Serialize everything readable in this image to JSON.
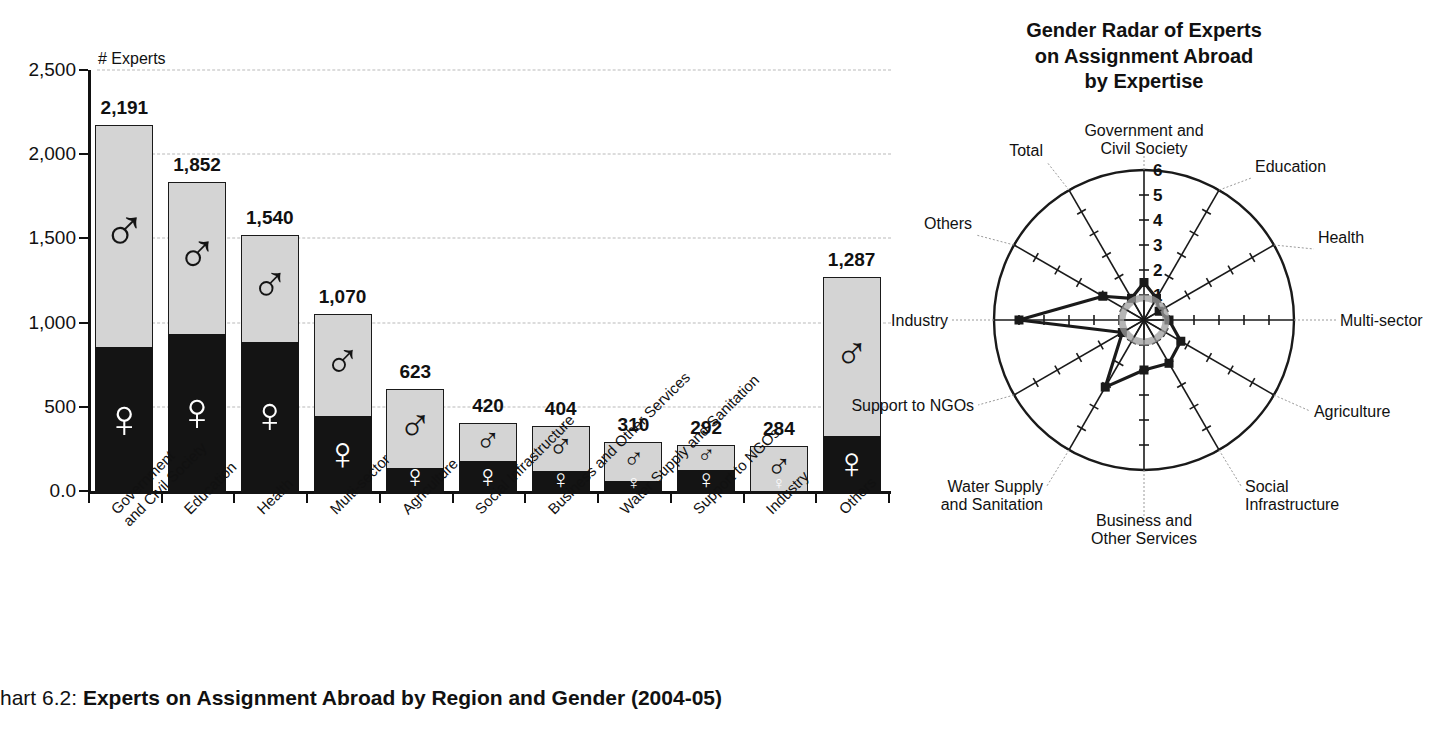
{
  "caption": {
    "number": "hart 6.2:",
    "title": "Experts on Assignment Abroad by Region and Gender (2004-05)"
  },
  "bar_chart": {
    "y_axis_title": "# Experts",
    "y_ticks": [
      "0.0",
      "500",
      "1,000",
      "1,500",
      "2,000",
      "2,500"
    ],
    "male_symbol": "♂",
    "female_symbol": "♀"
  },
  "radar_chart": {
    "title_line1": "Gender Radar of Experts",
    "title_line2": "on Assignment Abroad",
    "title_line3": "by Expertise"
  },
  "chart_data": [
    {
      "type": "bar",
      "subtype": "stacked-vertical",
      "title": "Experts on Assignment Abroad by Region and Gender (2004-05)",
      "xlabel": "",
      "ylabel": "# Experts",
      "ylim": [
        0,
        2500
      ],
      "yticks": [
        0,
        500,
        1000,
        1500,
        2000,
        2500
      ],
      "ytick_labels": [
        "0.0",
        "500",
        "1,000",
        "1,500",
        "2,000",
        "2,500"
      ],
      "grid": true,
      "legend": "none (in-bar gender glyphs)",
      "categories": [
        "Government and Civil Society",
        "Education",
        "Health",
        "Multi-sector",
        "Agriculture",
        "Social Infrastructure",
        "Business and Other Services",
        "Water Supply and Sanitation",
        "Support to NGOs",
        "Industry",
        "Others"
      ],
      "category_label_lines": [
        [
          "Government",
          "and Civil Society"
        ],
        [
          "Education"
        ],
        [
          "Health"
        ],
        [
          "Multi-sector"
        ],
        [
          "Agriculture"
        ],
        [
          "Social Infrastructure"
        ],
        [
          "Business and Other Services"
        ],
        [
          "Water Supply and Sanitation"
        ],
        [
          "Support to NGOs"
        ],
        [
          "Industry"
        ],
        [
          "Others"
        ]
      ],
      "totals": [
        2191,
        1852,
        1540,
        1070,
        623,
        420,
        404,
        310,
        292,
        284,
        1287
      ],
      "total_labels": [
        "2,191",
        "1,852",
        "1,540",
        "1,070",
        "623",
        "420",
        "404",
        "310",
        "292",
        "284",
        "1,287"
      ],
      "series": [
        {
          "name": "Female",
          "color": "#141414",
          "values": [
            872,
            950,
            905,
            465,
            155,
            195,
            135,
            75,
            145,
            20,
            345
          ]
        },
        {
          "name": "Male",
          "color": "#d4d4d4",
          "values": [
            1319,
            902,
            635,
            605,
            468,
            225,
            269,
            235,
            147,
            264,
            942
          ]
        }
      ]
    },
    {
      "type": "radar",
      "title": "Gender Radar of Experts on Assignment Abroad by Expertise",
      "rlim": [
        0,
        6
      ],
      "rticks": [
        1,
        2,
        3,
        4,
        5,
        6
      ],
      "rtick_labels": [
        "1",
        "2",
        "3",
        "4",
        "5",
        "6"
      ],
      "grid": true,
      "legend": "none",
      "categories": [
        "Government and Civil Society",
        "Education",
        "Health",
        "Multi-sector",
        "Agriculture",
        "Social Infrastructure",
        "Business and Other Services",
        "Water Supply and Sanitation",
        "Support to NGOs",
        "Industry",
        "Others",
        "Total"
      ],
      "category_label_lines": [
        [
          "Government and",
          "Civil Society"
        ],
        [
          "Education"
        ],
        [
          "Health"
        ],
        [
          "Multi-sector"
        ],
        [
          "Agriculture"
        ],
        [
          "Social",
          "Infrastructure"
        ],
        [
          "Business and",
          "Other Services"
        ],
        [
          "Water Supply",
          "and Sanitation"
        ],
        [
          "Support to NGOs"
        ],
        [
          "Industry"
        ],
        [
          "Others"
        ],
        [
          "Total"
        ]
      ],
      "series": [
        {
          "name": "Male to female ratio",
          "values": [
            1.5,
            1.0,
            0.7,
            1.0,
            1.7,
            2.0,
            2.0,
            3.1,
            1.0,
            5.0,
            1.9,
            1.0
          ]
        }
      ]
    }
  ]
}
